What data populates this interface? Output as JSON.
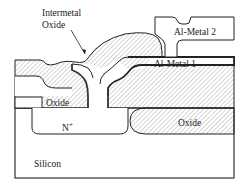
{
  "diagram": {
    "type": "semiconductor-cross-section",
    "labels": {
      "intermetal_oxide_line1": "Intermetal",
      "intermetal_oxide_line2": "Oxide",
      "metal2": "Al-Metal 2",
      "metal1": "Al-Metal 1",
      "oxide_left": "Oxide",
      "oxide_right": "Oxide",
      "n_plus": "N",
      "n_plus_sup": "+",
      "silicon": "Silicon"
    },
    "colors": {
      "stroke": "#222222",
      "hatch": "#8a8a8a",
      "contact": "#111111",
      "background": "#ffffff"
    }
  }
}
